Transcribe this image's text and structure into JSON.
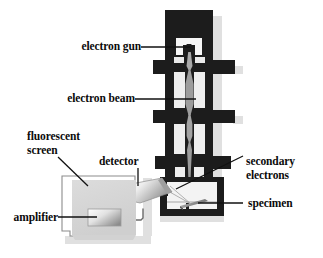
{
  "figure": {
    "background_color": "#ffffff",
    "ink_color": "#0b0b0b"
  },
  "labels": {
    "electron_gun": "electron gun",
    "electron_beam": "electron beam",
    "fluorescent_screen_line1": "fluorescent",
    "fluorescent_screen_line2": "screen",
    "detector": "detector",
    "amplifier": "amplifier",
    "secondary_line1": "secondary",
    "secondary_line2": "electrons",
    "specimen": "specimen"
  },
  "colors": {
    "column_body": "#1c1c1c",
    "column_body_alt": "#232323",
    "beam_gray": "#9c9c9c",
    "beam_gray_light": "#b4b4b4",
    "chamber_fill": "#f2f2f2",
    "lens_gap": "#e8e8e8",
    "monitor_fill": "#d5d5d5",
    "monitor_edge": "#8a8a8a",
    "detector_light": "#f4f4f4",
    "detector_dark": "#9a9a9a",
    "specimen_gray": "#8d8d8d",
    "shadow": "#dedede",
    "leader_line": "#111111"
  },
  "parts": [
    {
      "name": "electron-gun",
      "description": "dark block with cathode notch at column top"
    },
    {
      "name": "condenser-lens-1",
      "description": "first magnetic lens with side flanges"
    },
    {
      "name": "condenser-lens-2",
      "description": "second magnetic lens"
    },
    {
      "name": "objective-lens",
      "description": "lower magnetic lens above chamber"
    },
    {
      "name": "electron-beam",
      "description": "gray converging beam down the column axis"
    },
    {
      "name": "specimen-chamber",
      "description": "boxed chamber at column base"
    },
    {
      "name": "specimen",
      "description": "tilted gray plate on stage"
    },
    {
      "name": "secondary-electron-detector",
      "description": "angled gray cylinder entering chamber from left"
    },
    {
      "name": "signal-cable",
      "description": "thin line from detector to monitor"
    },
    {
      "name": "fluorescent-screen",
      "description": "CRT display box at lower left"
    },
    {
      "name": "amplifier",
      "description": "small shaded screen inset in display"
    }
  ]
}
